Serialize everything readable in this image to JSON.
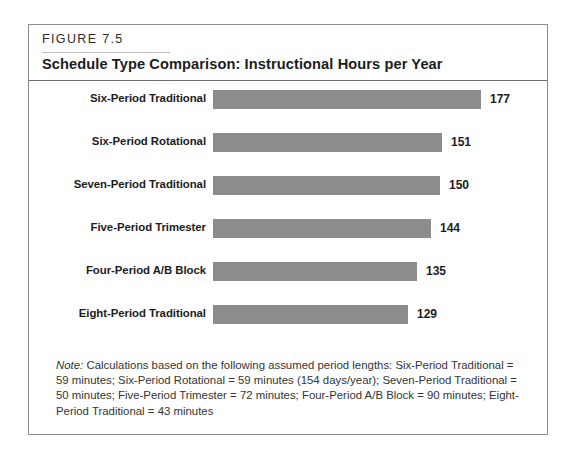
{
  "figure": {
    "number_label": "FIGURE 7.5",
    "title": "Schedule Type Comparison: Instructional Hours per Year",
    "note_label": "Note:",
    "note_body": " Calculations based on the following assumed period lengths: Six-Period Traditional = 59 minutes; Six-Period Rotational = 59 minutes (154 days/year); Seven-Period Traditional = 50 minutes; Five-Period Trimester = 72 minutes; Four-Period A/B Block = 90 minutes; Eight-Period Traditional = 43 minutes"
  },
  "colors": {
    "bar_fill": "#8c8c8c",
    "frame_border": "#8c8c8c",
    "title_rule": "#6e6e6e",
    "figure_rule": "#bdbdbd",
    "text": "#1c1c1c",
    "note_text": "#343434",
    "background": "#ffffff"
  },
  "chart_data": {
    "type": "bar",
    "orientation": "horizontal",
    "title": "Schedule Type Comparison: Instructional Hours per Year",
    "xlabel": "",
    "ylabel": "",
    "grid": false,
    "legend": false,
    "axis_visible": false,
    "value_labels": true,
    "xlim": [
      0,
      200
    ],
    "categories": [
      "Six-Period Traditional",
      "Six-Period Rotational",
      "Seven-Period Traditional",
      "Five-Period Trimester",
      "Four-Period A/B Block",
      "Eight-Period Traditional"
    ],
    "values": [
      177,
      151,
      150,
      144,
      135,
      129
    ],
    "value_label_text": [
      "177",
      "151",
      "150",
      "144",
      "135",
      "129"
    ],
    "units": "instructional hours per year"
  },
  "bars": [
    {
      "label": "Six-Period Traditional",
      "value": 177,
      "value_text": "177",
      "top": 9,
      "width": 268
    },
    {
      "label": "Six-Period Rotational",
      "value": 151,
      "value_text": "151",
      "top": 52,
      "width": 229
    },
    {
      "label": "Seven-Period Traditional",
      "value": 150,
      "value_text": "150",
      "top": 95,
      "width": 227
    },
    {
      "label": "Five-Period Trimester",
      "value": 144,
      "value_text": "144",
      "top": 138,
      "width": 218
    },
    {
      "label": "Four-Period A/B Block",
      "value": 135,
      "value_text": "135",
      "top": 181,
      "width": 204
    },
    {
      "label": "Eight-Period Traditional",
      "value": 129,
      "value_text": "129",
      "top": 224,
      "width": 195
    }
  ]
}
